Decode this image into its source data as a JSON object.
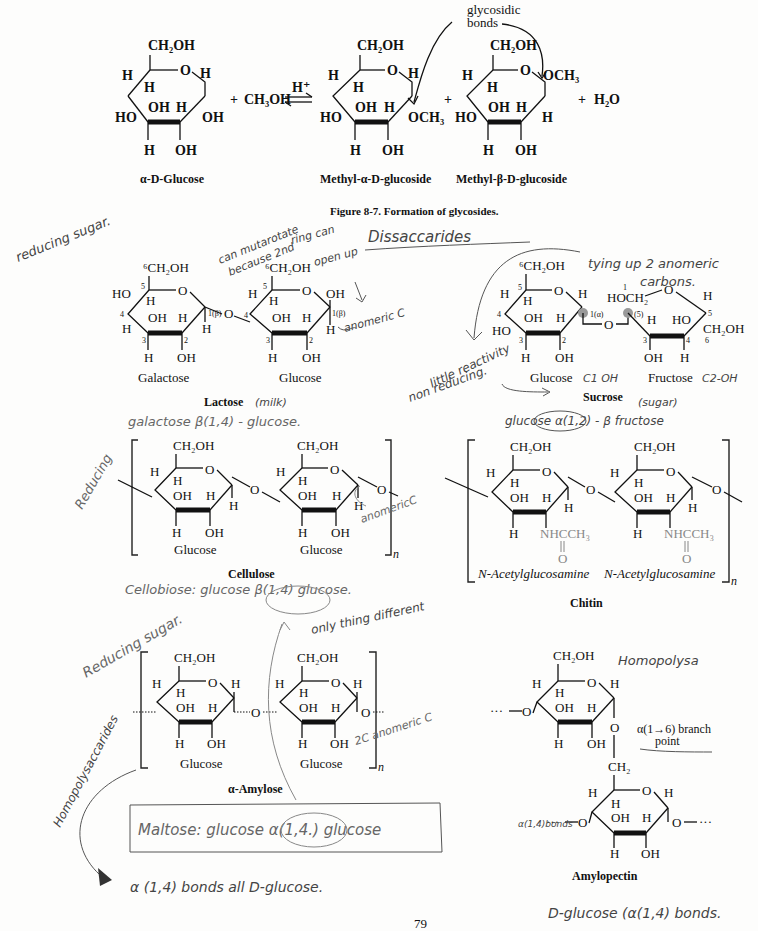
{
  "page": {
    "page_number": "79",
    "figure_caption": "Figure 8-7.   Formation of glycosides."
  },
  "reaction": {
    "reactant": "α-D-Glucose",
    "plus1": "+",
    "reagent": "CH₃OH",
    "catalyst": "H⁺",
    "product1": "Methyl-α-D-glucoside",
    "plus2": "+",
    "product2": "Methyl-β-D-glucoside",
    "plus3": "+",
    "byproduct": "H₂O",
    "annotation": [
      "glycosidic",
      "bonds"
    ]
  },
  "structures": {
    "lactose": {
      "title": "Lactose",
      "units": [
        "Galactose",
        "Glucose"
      ],
      "linkage_labels": [
        "1(β)",
        "4",
        "1(β)"
      ]
    },
    "sucrose": {
      "title": "Sucrose",
      "units": [
        "Glucose",
        "Fructose"
      ],
      "linkage_labels": [
        "1(α)",
        "2(β)"
      ]
    },
    "cellulose": {
      "title": "Cellulose",
      "units": [
        "Glucose",
        "Glucose"
      ],
      "repeat": "n"
    },
    "chitin": {
      "title": "Chitin",
      "units": [
        "N-Acetylglucosamine",
        "N-Acetylglucosamine"
      ],
      "substituent": "NHCCH₃",
      "repeat": "n"
    },
    "amylose": {
      "title": "α-Amylose",
      "units": [
        "Glucose",
        "Glucose"
      ],
      "repeat": "n"
    },
    "amylopectin": {
      "title": "Amylopectin",
      "branch_label": [
        "α(1→6) branch",
        "point"
      ],
      "linker": "CH₂"
    }
  },
  "atoms": {
    "ch2oh": "CH₂OH",
    "ch2oh6": "⁶CH₂OH",
    "h": "H",
    "oh": "OH",
    "ho": "HO",
    "o": "O",
    "och3": "OCH₃",
    "hoch2": "HOCH₂",
    "dots": "···"
  },
  "handwritten_notes": {
    "reducing_sugar": "reducing sugar.",
    "mutarotate": [
      "can mutarotate",
      "because 2nd",
      "ring can",
      "open up"
    ],
    "disaccarides": "Dissaccarides",
    "anomeric_c": "anomeric C",
    "tying_up": [
      "tying up 2 anomeric",
      "carbons."
    ],
    "little_reactivity": [
      "little reactivity",
      "non reducing."
    ],
    "glucose_c1_oh": "C1 OH",
    "fructose_c2_oh": "C2-OH",
    "milk": "(milk)",
    "sugar": "(sugar)",
    "lactose_bond": "galactose β(1,4) - glucose.",
    "sucrose_bond": "glucose α(1,2) - β fructose",
    "reducing": "Reducing",
    "anomeric_c2": "anomericC",
    "cellobiose": "Cellobiose: glucose β(1,4) glucose.",
    "reducing_sugar2": "Reducing sugar.",
    "only_thing_different": "only thing different",
    "anomeric_c3": "2C anomeric C",
    "homopolysaccarides": "Homopolysaccarides",
    "maltose": "Maltose:  glucose  α(1,4.)  glucose",
    "alpha_bonds": "α (1,4)  bonds  all  D-glucose.",
    "homopolysa": "Homopolysa",
    "alpha_14_bonds": "α(1,4)bonds",
    "d_glucose_bonds": "D-glucose (α(1,4) bonds."
  }
}
